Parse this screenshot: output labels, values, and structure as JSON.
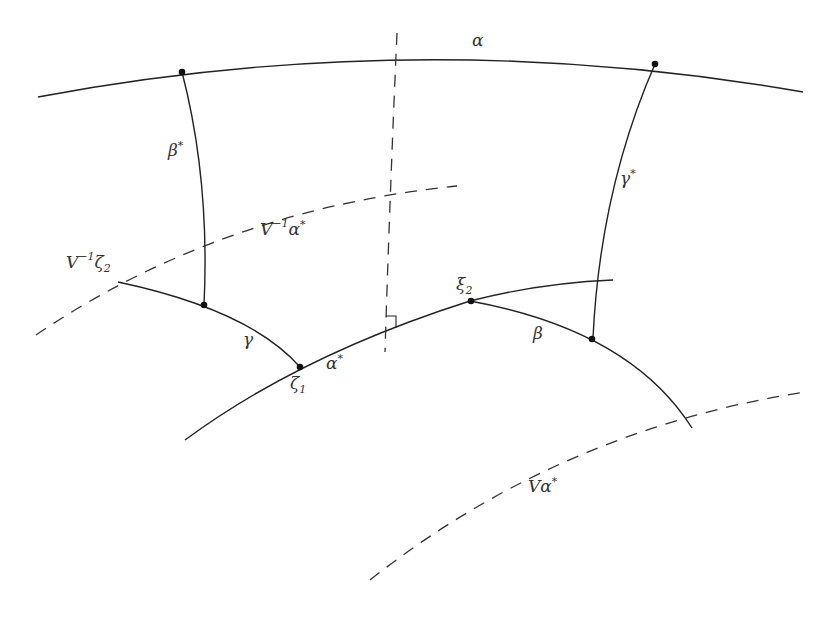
{
  "diagram": {
    "type": "hyperbolic-geometry-figure",
    "curves": [
      {
        "id": "alpha",
        "label": "α",
        "style": "solid"
      },
      {
        "id": "beta-star",
        "label": "β*",
        "style": "solid"
      },
      {
        "id": "gamma-star",
        "label": "γ*",
        "style": "solid"
      },
      {
        "id": "gamma",
        "label": "γ",
        "style": "solid"
      },
      {
        "id": "alpha-star",
        "label": "α*",
        "style": "solid"
      },
      {
        "id": "beta",
        "label": "β",
        "style": "solid"
      },
      {
        "id": "v-inv-alpha-star",
        "label": "V⁻¹α*",
        "style": "dashed"
      },
      {
        "id": "v-alpha-star",
        "label": "Vα*",
        "style": "dashed"
      },
      {
        "id": "perpendicular",
        "label": "",
        "style": "dashed"
      }
    ],
    "labels": {
      "alpha": "α",
      "beta_star_base": "β",
      "beta_star_sup": "*",
      "gamma_star_base": "γ",
      "gamma_star_sup": "*",
      "v_inv_alpha_star_base": "V",
      "v_inv_alpha_star_sup": "−1",
      "v_inv_alpha_star_tail": "α",
      "v_inv_alpha_star_tail_sup": "*",
      "v_inv_zeta2_base": "V",
      "v_inv_zeta2_sup": "−1",
      "v_inv_zeta2_tail": "ζ",
      "v_inv_zeta2_sub": "2",
      "xi2_base": "ξ",
      "xi2_sub": "2",
      "gamma": "γ",
      "beta": "β",
      "alpha_star_base": "α",
      "alpha_star_sup": "*",
      "zeta1_base": "ζ",
      "zeta1_sub": "1",
      "v_alpha_star_base": "Vα",
      "v_alpha_star_sup": "*"
    },
    "points": [
      "alpha∩beta*",
      "alpha∩gamma*",
      "gamma∩beta*",
      "zeta1",
      "xi2",
      "beta∩gamma*"
    ],
    "annotations": [
      "right-angle marker at perpendicular ∩ alpha*"
    ]
  }
}
